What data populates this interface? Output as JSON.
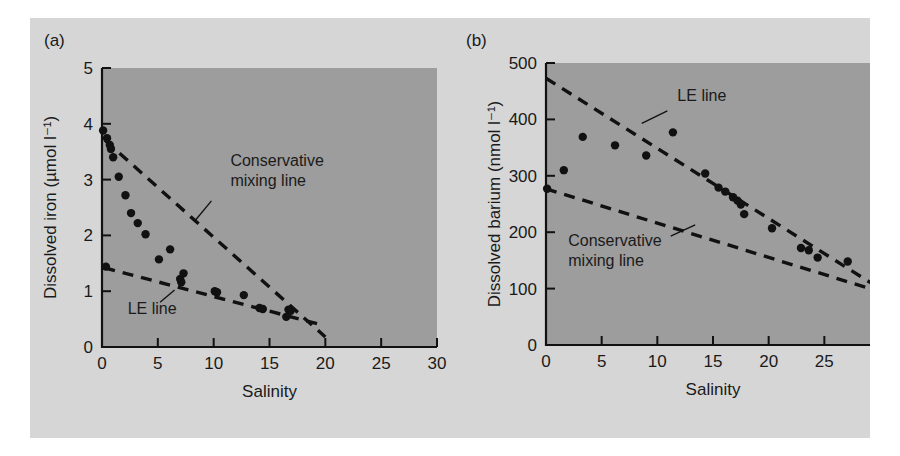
{
  "figure": {
    "background": "#d6d6d6",
    "plot_area_color": "#9d9d9d",
    "ink_color": "#111111"
  },
  "chart_data": [
    {
      "type": "scatter",
      "panel_label": "(a)",
      "title": "",
      "xlabel": "Salinity",
      "ylabel": "Dissolved iron (µmol l⁻¹)",
      "xlim": [
        0,
        30
      ],
      "ylim": [
        0,
        5
      ],
      "xticks": [
        0,
        5,
        10,
        15,
        20,
        25,
        30
      ],
      "yticks": [
        0,
        1,
        2,
        3,
        4,
        5
      ],
      "xticklabels": [
        "0",
        "5",
        "10",
        "15",
        "20",
        "25",
        "30"
      ],
      "yticklabels": [
        "0",
        "1",
        "2",
        "3",
        "4",
        "5"
      ],
      "grid": false,
      "legend": "none",
      "points": [
        [
          0.1,
          3.88
        ],
        [
          0.45,
          3.74
        ],
        [
          0.7,
          3.62
        ],
        [
          0.8,
          3.55
        ],
        [
          1.0,
          3.4
        ],
        [
          1.5,
          3.05
        ],
        [
          2.1,
          2.72
        ],
        [
          2.6,
          2.4
        ],
        [
          3.2,
          2.22
        ],
        [
          3.9,
          2.02
        ],
        [
          6.1,
          1.75
        ],
        [
          5.1,
          1.57
        ],
        [
          7.3,
          1.32
        ],
        [
          7.0,
          1.22
        ],
        [
          7.1,
          1.16
        ],
        [
          10.1,
          1.0
        ],
        [
          10.3,
          0.98
        ],
        [
          12.7,
          0.93
        ],
        [
          14.1,
          0.7
        ],
        [
          14.4,
          0.68
        ],
        [
          16.7,
          0.67
        ],
        [
          16.9,
          0.65
        ],
        [
          16.5,
          0.54
        ],
        [
          0.35,
          1.44
        ]
      ],
      "lines": [
        {
          "name": "Conservative mixing line",
          "style": "dashed",
          "x": [
            0.3,
            20.0
          ],
          "y": [
            3.7,
            0.18
          ],
          "label": "Conservative\nmixing line",
          "label_lines": [
            "Conservative",
            "mixing line"
          ],
          "label_x": 11.5,
          "label_y": 3.25,
          "leader_from": [
            9.8,
            2.62
          ],
          "leader_to": [
            8.4,
            2.28
          ]
        },
        {
          "name": "LE line",
          "style": "dashed",
          "x": [
            0.2,
            19.6
          ],
          "y": [
            1.42,
            0.4
          ],
          "label": "LE line",
          "label_lines": [
            "LE line"
          ],
          "label_x": 2.3,
          "label_y": 0.6,
          "leader_from": [
            5.2,
            0.8
          ],
          "leader_to": [
            6.5,
            1.02
          ]
        }
      ]
    },
    {
      "type": "scatter",
      "panel_label": "(b)",
      "title": "",
      "xlabel": "Salinity",
      "ylabel": "Dissolved barium (nmol l⁻¹)",
      "xlim": [
        0,
        30
      ],
      "ylim": [
        0,
        500
      ],
      "xticks": [
        0,
        5,
        10,
        15,
        20,
        25,
        30
      ],
      "yticks": [
        0,
        100,
        200,
        300,
        400,
        500
      ],
      "xticklabels": [
        "0",
        "5",
        "10",
        "15",
        "20",
        "25",
        "30"
      ],
      "yticklabels": [
        "0",
        "100",
        "200",
        "300",
        "400",
        "500"
      ],
      "grid": false,
      "legend": "none",
      "points": [
        [
          1.6,
          310
        ],
        [
          3.3,
          369
        ],
        [
          6.2,
          354
        ],
        [
          9.0,
          336
        ],
        [
          11.4,
          377
        ],
        [
          14.3,
          304
        ],
        [
          15.5,
          279
        ],
        [
          16.1,
          272
        ],
        [
          16.8,
          262
        ],
        [
          17.2,
          256
        ],
        [
          17.5,
          249
        ],
        [
          17.8,
          232
        ],
        [
          20.3,
          207
        ],
        [
          22.9,
          172
        ],
        [
          23.6,
          168
        ],
        [
          24.4,
          155
        ],
        [
          27.1,
          148
        ],
        [
          30.3,
          92
        ],
        [
          0.1,
          277
        ]
      ],
      "lines": [
        {
          "name": "LE line",
          "style": "dashed",
          "x": [
            0.0,
            30.4
          ],
          "y": [
            473,
            95
          ],
          "label": "LE line",
          "label_lines": [
            "LE line"
          ],
          "label_x": 11.8,
          "label_y": 432,
          "leader_from": [
            10.9,
            415
          ],
          "leader_to": [
            8.6,
            393
          ]
        },
        {
          "name": "Conservative mixing line",
          "style": "dashed",
          "x": [
            0.0,
            30.4
          ],
          "y": [
            277,
            92
          ],
          "label": "Conservative\nmixing line",
          "label_lines": [
            "Conservative",
            "mixing line"
          ],
          "label_x": 2.0,
          "label_y": 175,
          "leader_from": [
            11.2,
            193
          ],
          "leader_to": [
            13.4,
            213
          ]
        }
      ]
    }
  ]
}
